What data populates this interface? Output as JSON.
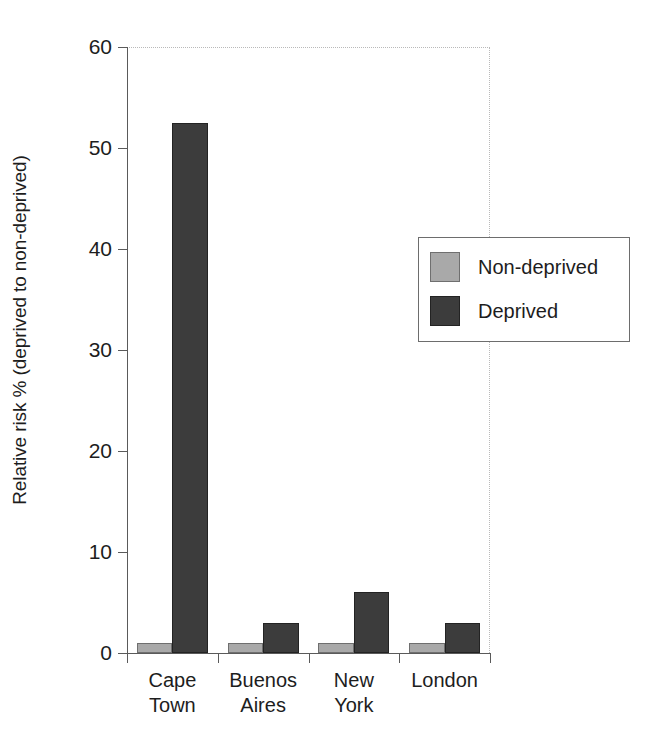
{
  "chart_data": {
    "type": "bar",
    "title": "",
    "subtitle": "",
    "xlabel": "",
    "ylabel": "Relative risk % (deprived to non-deprived)",
    "categories": [
      "Cape\nTown",
      "Buenos\nAires",
      "New\nYork",
      "London"
    ],
    "series": [
      {
        "name": "Non-deprived",
        "color": "#a9a9a9",
        "values": [
          1,
          1,
          1,
          1
        ]
      },
      {
        "name": "Deprived",
        "color": "#3c3c3c",
        "values": [
          52.5,
          3,
          6,
          3
        ]
      }
    ],
    "ylim": [
      0,
      60
    ],
    "yticks": [
      0,
      10,
      20,
      30,
      40,
      50,
      60
    ],
    "ytick_labels": [
      "0",
      "10",
      "20",
      "30",
      "40",
      "50",
      "60"
    ],
    "grid": false,
    "legend_position": "center-right",
    "legend_entries": [
      {
        "label": "Non-deprived",
        "color": "#a9a9a9"
      },
      {
        "label": "Deprived",
        "color": "#3c3c3c"
      }
    ]
  },
  "colors": {
    "background": "#ffffff",
    "axis": "#5a5a5a",
    "text": "#1d1d1d",
    "plot_border": "#b9b9b9",
    "legend_border": "#6d6d6d"
  }
}
